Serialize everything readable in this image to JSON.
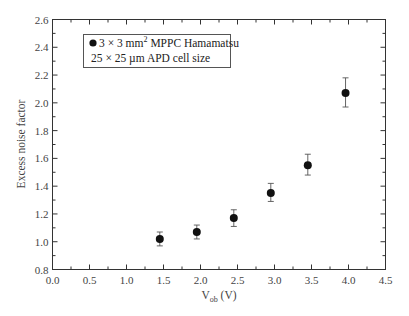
{
  "chart_data": {
    "type": "scatter",
    "title": "",
    "xlabel": "V_ob (V)",
    "xlabel_main": "V",
    "xlabel_sub": "ob",
    "xlabel_unit": " (V)",
    "ylabel": "Excess noise factor",
    "xlim": [
      0.0,
      4.5
    ],
    "ylim": [
      0.8,
      2.6
    ],
    "x_ticks": [
      "0.0",
      "0.5",
      "1.0",
      "1.5",
      "2.0",
      "2.5",
      "3.0",
      "3.5",
      "4.0",
      "4.5"
    ],
    "y_ticks": [
      "0.8",
      "1.0",
      "1.2",
      "1.4",
      "1.6",
      "1.8",
      "2.0",
      "2.2",
      "2.4",
      "2.6"
    ],
    "grid": false,
    "legend_position": "upper-left",
    "series": [
      {
        "name": "3 × 3 mm² MPPC Hamamatsu",
        "marker": "filled-circle",
        "color": "#111111",
        "x": [
          1.45,
          1.95,
          2.45,
          2.95,
          3.45,
          3.96
        ],
        "y": [
          1.02,
          1.07,
          1.17,
          1.35,
          1.55,
          2.07
        ],
        "y_err_upper": [
          1.07,
          1.12,
          1.23,
          1.42,
          1.63,
          2.18
        ],
        "y_err_lower": [
          0.97,
          1.02,
          1.11,
          1.29,
          1.48,
          1.97
        ]
      }
    ],
    "legend": {
      "line1_prefix": "3 × 3 mm",
      "line1_sup": "2",
      "line1_suffix": " MPPC Hamamatsu",
      "line2": "25 × 25 µm APD cell size"
    }
  }
}
